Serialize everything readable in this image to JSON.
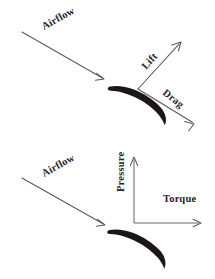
{
  "figure": {
    "type": "diagram",
    "background_color": "#ffffff",
    "line_color": "#5a5a5a",
    "label_color": "#252525",
    "airfoil_color": "#1c1714",
    "panels": [
      {
        "id": "upper-panel",
        "name": "lift-drag-panel",
        "airflow": {
          "label": "Airflow",
          "label_rotation_deg": -29,
          "start": {
            "x": 22,
            "y": 32
          },
          "end": {
            "x": 104,
            "y": 79
          },
          "label_pos": {
            "x": 44,
            "y": 30
          }
        },
        "airfoil": {
          "name": "airfoil-cross-section",
          "leading_edge": {
            "x": 110,
            "y": 88
          },
          "trailing_edge": {
            "x": 165,
            "y": 125
          }
        },
        "vectors": [
          {
            "label": "Lift",
            "name": "lift-vector",
            "origin": {
              "x": 138,
              "y": 89
            },
            "tip": {
              "x": 181,
              "y": 42
            },
            "label_rotation_deg": -48,
            "label_pos": {
              "x": 146,
              "y": 70
            }
          },
          {
            "label": "Drag",
            "name": "drag-vector",
            "origin": {
              "x": 138,
              "y": 89
            },
            "tip": {
              "x": 194,
              "y": 124
            },
            "label_rotation_deg": 38,
            "label_pos": {
              "x": 162,
              "y": 94
            }
          }
        ]
      },
      {
        "id": "lower-panel",
        "name": "pressure-torque-panel",
        "airflow": {
          "label": "Airflow",
          "label_rotation_deg": -29,
          "start": {
            "x": 22,
            "y": 178
          },
          "end": {
            "x": 105,
            "y": 225
          },
          "label_pos": {
            "x": 44,
            "y": 177
          }
        },
        "airfoil": {
          "name": "airfoil-cross-section",
          "leading_edge": {
            "x": 110,
            "y": 232
          },
          "trailing_edge": {
            "x": 164,
            "y": 268
          }
        },
        "vectors": [
          {
            "label": "Pressure",
            "name": "pressure-axis",
            "origin": {
              "x": 134,
              "y": 223
            },
            "tip": {
              "x": 134,
              "y": 157
            },
            "label_rotation_deg": -90,
            "label_pos": {
              "x": 124,
              "y": 192
            }
          },
          {
            "label": "Torque",
            "name": "torque-axis",
            "origin": {
              "x": 134,
              "y": 223
            },
            "tip": {
              "x": 201,
              "y": 223
            },
            "label_rotation_deg": 0,
            "label_pos": {
              "x": 163,
              "y": 202
            }
          }
        ]
      }
    ]
  }
}
